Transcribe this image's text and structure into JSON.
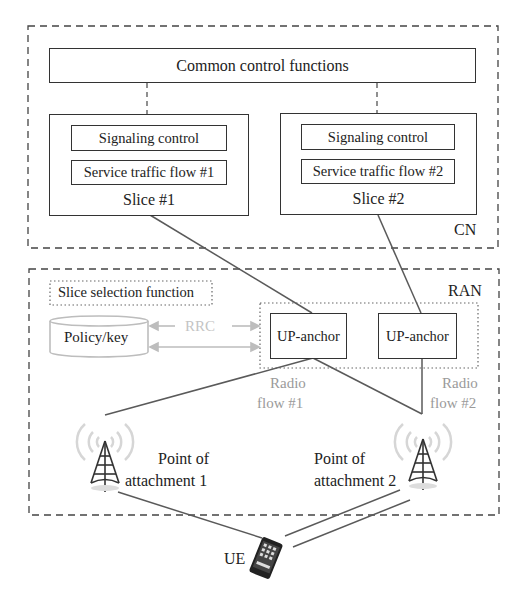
{
  "diagram": {
    "cn": {
      "label": "CN",
      "common_control": "Common control functions",
      "slices": [
        {
          "name": "Slice #1",
          "signaling": "Signaling control",
          "traffic": "Service traffic flow #1"
        },
        {
          "name": "Slice #2",
          "signaling": "Signaling control",
          "traffic": "Service traffic flow #2"
        }
      ]
    },
    "ran": {
      "label": "RAN",
      "slice_selection": "Slice selection function",
      "policy": "Policy/key",
      "rrc": "RRC",
      "up_anchors": [
        "UP-anchor",
        "UP-anchor"
      ],
      "radio_flows": [
        {
          "line1": "Radio",
          "line2": "flow #1"
        },
        {
          "line1": "Radio",
          "line2": "flow #2"
        }
      ],
      "attachments": [
        {
          "line1": "Point of",
          "line2": "attachment 1"
        },
        {
          "line1": "Point of",
          "line2": "attachment 2"
        }
      ]
    },
    "ue": {
      "label": "UE"
    },
    "colors": {
      "line": "#555555",
      "border": "#333333",
      "muted": "#a8a8a8"
    }
  }
}
